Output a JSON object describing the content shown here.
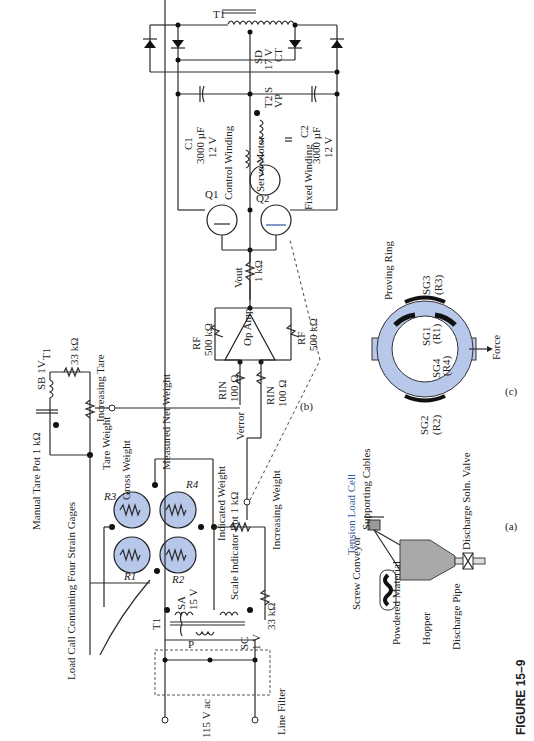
{
  "figure": {
    "title": "FIGURE 15–9",
    "panels": [
      "(a)",
      "(b)",
      "(c)"
    ]
  },
  "power_supply": {
    "transformer": "T1",
    "secondary_d": "SD",
    "secondary_d_voltage": "17 V",
    "secondary_d_tap": "CT",
    "c1_label": "C1",
    "c1_value": "3000 µF",
    "c1_voltage": "12 V",
    "c2_label": "C2",
    "c2_value": "3000 µF",
    "c2_voltage": "12 V"
  },
  "servo": {
    "control_winding": "Control Winding",
    "fixed_winding": "Fixed Winding",
    "motor": "Servo Motor",
    "t2_label": "T2 S",
    "vp_label": "VP",
    "q1": "Q1",
    "q2": "Q2",
    "r_base": "1 kΩ"
  },
  "amplifier": {
    "rf_top_label": "RF",
    "rf_top_value": "500 kΩ",
    "rf_bottom_label": "RF",
    "rf_bottom_value": "500 kΩ",
    "rin_top_label": "RIN",
    "rin_top_value": "100 Ω",
    "rin_bottom_label": "RIN",
    "rin_bottom_value": "100 Ω",
    "op_amp": "Op Amp",
    "vout": "Vout",
    "verror": "Verror"
  },
  "tare": {
    "transformer": "T1",
    "secondary": "SB 1V",
    "resistor": "33 kΩ",
    "increasing": "Increasing Tare",
    "tare_weight": "Tare Weight",
    "manual_pot": "Manual Tare Pot 1 kΩ"
  },
  "bridge": {
    "r1": "R1",
    "r2": "R2",
    "r3": "R3",
    "r4": "R4",
    "gross_weight": "Gross Weight",
    "measured_net_weight": "Measured Net Weight",
    "load_cell_note": "Load Call Containing Four Strain Gages"
  },
  "indicator": {
    "indicated_weight": "Indicated Weight",
    "increasing_weight": "Increasing Weight",
    "scale_pot": "Scale Indicator Pot 1 kΩ",
    "sc_label": "SC",
    "sc_voltage": "1 V",
    "resistor": "33 kΩ"
  },
  "input": {
    "transformer": "T1",
    "sa_label": "SA",
    "sa_voltage": "15 V",
    "primary": "P",
    "line_voltage": "115 V ac",
    "line_filter": "Line Filter"
  },
  "proving_ring": {
    "title": "Proving Ring",
    "sg1": "SG1",
    "sg1_r": "(R1)",
    "sg2": "SG2",
    "sg2_r": "(R2)",
    "sg3": "SG3",
    "sg3_r": "(R3)",
    "sg4": "SG4",
    "sg4_r": "(R4)",
    "force": "Force"
  },
  "hopper_system": {
    "tension_load_cell": "Tension Load Cell",
    "supporting_cables": "Supporting Cables",
    "discharge_valve": "Discharge Soln. Valve",
    "screw_conveyor": "Screw Conveyor",
    "powdered_material": "Powdered Material",
    "hopper": "Hopper",
    "discharge_pipe": "Discharge Pipe"
  }
}
